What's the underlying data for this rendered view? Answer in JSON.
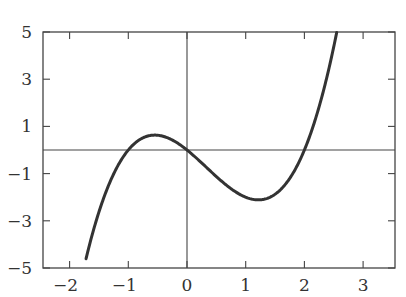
{
  "chart_data": {
    "type": "line",
    "title": "",
    "xlabel": "",
    "ylabel": "",
    "xlim": [
      -2.3,
      3.55
    ],
    "ylim": [
      -5,
      5
    ],
    "xticks": [
      -2,
      -1,
      0,
      1,
      2,
      3
    ],
    "xtick_labels": [
      "−2",
      "−1",
      "0",
      "1",
      "2",
      "3"
    ],
    "yticks": [
      -5,
      -3,
      -1,
      1,
      3,
      5
    ],
    "ytick_labels": [
      "−5",
      "−3",
      "−1",
      "1",
      "3",
      "5"
    ],
    "grid": false,
    "legend": null,
    "axes_lines": {
      "x0": true,
      "y0": true
    },
    "series": [
      {
        "name": "f(x) = x^3 - x^2 - 2x",
        "color": "#333333",
        "function": "x^3 - x^2 - 2x",
        "x": [
          -1.72,
          -1.5,
          -1.25,
          -1.0,
          -0.75,
          -0.5,
          -0.25,
          0.0,
          0.25,
          0.5,
          0.75,
          1.0,
          1.25,
          1.5,
          1.75,
          2.0,
          2.25,
          2.5,
          2.55
        ],
        "y": [
          -5.0,
          -2.63,
          -1.08,
          0.0,
          0.52,
          0.63,
          0.42,
          0.0,
          -0.55,
          -1.13,
          -1.64,
          -2.0,
          -2.11,
          -1.88,
          -1.2,
          0.0,
          1.83,
          4.38,
          5.0
        ]
      }
    ],
    "key_points": {
      "roots": [
        -1,
        0,
        2
      ],
      "local_max": {
        "x": -0.55,
        "y": 0.63
      },
      "local_min": {
        "x": 1.22,
        "y": -2.11
      }
    }
  },
  "colors": {
    "axes": "#444444",
    "curve": "#333333",
    "background": "#ffffff"
  }
}
